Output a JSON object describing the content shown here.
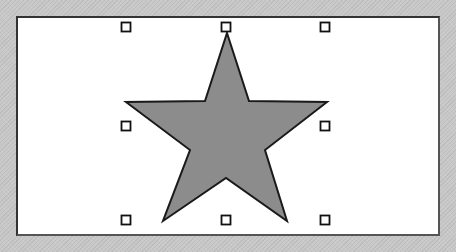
{
  "canvas": {
    "background": "#ffffff",
    "frame_border": "#333333"
  },
  "shape": {
    "type": "star",
    "fill": "#8c8c8c",
    "stroke": "#1a1a1a",
    "points": "227,33 249,101 327,102 265,150 287,221 226,178 163,221 190,150 126,102 205,101"
  },
  "selection_handles": [
    {
      "name": "handle-top-left",
      "x": 126,
      "y": 27
    },
    {
      "name": "handle-top-center",
      "x": 226,
      "y": 27
    },
    {
      "name": "handle-top-right",
      "x": 325,
      "y": 27
    },
    {
      "name": "handle-middle-left",
      "x": 126,
      "y": 126
    },
    {
      "name": "handle-middle-right",
      "x": 325,
      "y": 126
    },
    {
      "name": "handle-bottom-left",
      "x": 126,
      "y": 220
    },
    {
      "name": "handle-bottom-center",
      "x": 226,
      "y": 220
    },
    {
      "name": "handle-bottom-right",
      "x": 325,
      "y": 220
    }
  ]
}
